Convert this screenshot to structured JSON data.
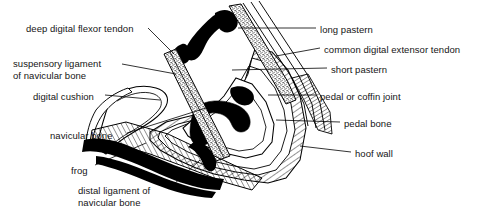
{
  "figure": {
    "type": "anatomical-line-diagram",
    "background_color": "#ffffff",
    "line_color": "#000000",
    "fill_black": "#000000",
    "labels": [
      {
        "id": "deep-digital-flexor-tendon",
        "text": "deep digital flexor tendon",
        "side": "left",
        "x": 26,
        "y": 23
      },
      {
        "id": "suspensory-ligament-of-navicular-bone",
        "text": "suspensory ligament\nof navicular bone",
        "side": "left",
        "x": 13,
        "y": 58
      },
      {
        "id": "digital-cushion",
        "text": "digital cushion",
        "side": "left",
        "x": 33,
        "y": 91
      },
      {
        "id": "navicular-bone",
        "text": "navicular bone",
        "side": "left",
        "x": 50,
        "y": 130
      },
      {
        "id": "frog",
        "text": "frog",
        "side": "left",
        "x": 71,
        "y": 165
      },
      {
        "id": "distal-ligament-of-navicular-bone",
        "text": "distal ligament of\nnavicular bone",
        "side": "left",
        "x": 78,
        "y": 185
      },
      {
        "id": "long-pastern",
        "text": "long pastern",
        "side": "right",
        "x": 320,
        "y": 24
      },
      {
        "id": "common-digital-extensor-tendon",
        "text": "common digital extensor tendon",
        "side": "right",
        "x": 324,
        "y": 44
      },
      {
        "id": "short-pastern",
        "text": "short pastern",
        "side": "right",
        "x": 331,
        "y": 64
      },
      {
        "id": "pedal-or-coffin-joint",
        "text": "pedal or coffin joint",
        "side": "right",
        "x": 320,
        "y": 91
      },
      {
        "id": "pedal-bone",
        "text": "pedal bone",
        "side": "right",
        "x": 344,
        "y": 118
      },
      {
        "id": "hoof-wall",
        "text": "hoof wall",
        "side": "right",
        "x": 355,
        "y": 148
      }
    ]
  }
}
